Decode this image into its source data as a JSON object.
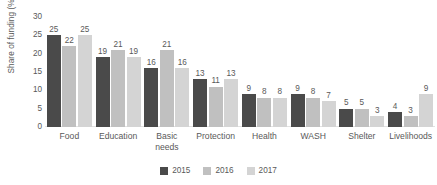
{
  "chart_data": {
    "type": "bar",
    "title": "",
    "subtitle": "",
    "xlabel": "",
    "ylabel": "Share of funding (%)",
    "ylim": [
      0,
      30
    ],
    "yticks": [
      30,
      25,
      20,
      15,
      10,
      5,
      0
    ],
    "ytick_labels": [
      "30",
      "25",
      "20",
      "15",
      "10",
      "5",
      "0"
    ],
    "grid": false,
    "legend_position": "bottom-center",
    "value_labels": true,
    "categories": [
      "Food",
      "Education",
      "Basic\nneeds",
      "Protection",
      "Health",
      "WASH",
      "Shelter",
      "Livelihoods"
    ],
    "series": [
      {
        "name": "2015",
        "color": "#4a4a4a",
        "values": [
          25,
          19,
          16,
          13,
          9,
          9,
          5,
          4
        ]
      },
      {
        "name": "2016",
        "color": "#c0c0c0",
        "values": [
          22,
          21,
          21,
          11,
          8,
          8,
          5,
          3
        ]
      },
      {
        "name": "2017",
        "color": "#d4d4d4",
        "values": [
          25,
          19,
          16,
          13,
          8,
          7,
          3,
          9
        ]
      }
    ]
  }
}
